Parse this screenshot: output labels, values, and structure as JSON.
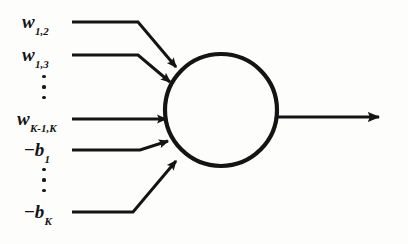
{
  "figure": {
    "type": "neuron-schematic",
    "background_color": "#fdfdfc",
    "ink_color": "#141414"
  },
  "inputs": [
    {
      "id": "w-1-2",
      "name": "weight-w-1-2",
      "base": "w",
      "subscript": "1,2",
      "label": "w1,2",
      "label_x": 22,
      "label_y": 12,
      "path": "M72,22 L138,22 L176,67",
      "arrow_angle_deg": 50
    },
    {
      "id": "w-1-3",
      "name": "weight-w-1-3",
      "base": "w",
      "subscript": "1,3",
      "label": "w1,3",
      "label_x": 22,
      "label_y": 45,
      "path": "M72,55 L138,55 L170,82",
      "arrow_angle_deg": 40
    },
    {
      "id": "w-k1-k",
      "name": "weight-w-k-minus-1-k",
      "base": "w",
      "subscript": "K-1,K",
      "label": "wK-1,K",
      "label_x": 17,
      "label_y": 109,
      "path": "M72,119 L166,119",
      "arrow_angle_deg": 0
    },
    {
      "id": "b-1",
      "name": "bias-b-1",
      "base": "b",
      "subscript": "1",
      "sign": "−",
      "label": "−b1",
      "label_x": 24,
      "label_y": 140,
      "path": "M72,150 L140,150 L168,141",
      "arrow_angle_deg": -18
    },
    {
      "id": "b-k",
      "name": "bias-b-k",
      "base": "b",
      "subscript": "K",
      "sign": "−",
      "label": "−bK",
      "label_x": 24,
      "label_y": 202,
      "path": "M72,212 L133,212 L176,161",
      "arrow_angle_deg": -50
    }
  ],
  "ellipses": [
    {
      "id": "dots-upper",
      "name": "vertical-ellipsis-upper",
      "glyph": "⋮",
      "x": 41,
      "y": 75,
      "count": 3
    },
    {
      "id": "dots-lower",
      "name": "vertical-ellipsis-lower",
      "glyph": "⋮",
      "x": 41,
      "y": 168,
      "count": 3
    }
  ],
  "node": {
    "name": "summation-node",
    "shape": "circle",
    "center_x": 221,
    "center_y": 110,
    "radius": 56,
    "stroke_width": 4.2,
    "fill": "none",
    "stroke": "#141414"
  },
  "output": {
    "name": "output-arrow",
    "path": "M277,117 L379,117",
    "arrow_tip_x": 385,
    "arrow_tip_y": 117,
    "label": ""
  },
  "style": {
    "line_width": 3.0,
    "arrow_head_length": 13,
    "arrow_head_width": 11
  }
}
